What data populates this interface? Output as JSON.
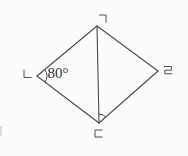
{
  "figure": {
    "type": "geometry-diagram",
    "shape": "quadrilateral-with-diagonal",
    "background": "#fcfcfc",
    "line_color": "#4a4a4a",
    "label_color": "#4f4f4f",
    "angle_text_color": "#2f2f2f",
    "vertices": {
      "top": {
        "label": "ㄱ",
        "glyph": "giyeok",
        "x": 97,
        "y": 26,
        "label_x": 103,
        "label_y": 18
      },
      "left": {
        "label": "ㄴ",
        "glyph": "nieun",
        "x": 37,
        "y": 76,
        "label_x": 27,
        "label_y": 74
      },
      "bottom": {
        "label": "ㄷ",
        "glyph": "digeut",
        "x": 99,
        "y": 123,
        "label_x": 98,
        "label_y": 133
      },
      "right": {
        "label": "ㄹ",
        "glyph": "rieul",
        "x": 158,
        "y": 71,
        "label_x": 168,
        "label_y": 70
      }
    },
    "edges": [
      {
        "from": "top",
        "to": "left"
      },
      {
        "from": "left",
        "to": "bottom"
      },
      {
        "from": "bottom",
        "to": "right"
      },
      {
        "from": "right",
        "to": "top"
      }
    ],
    "diagonal": {
      "from": "top",
      "to": "bottom"
    },
    "angle_marks": [
      {
        "vertex": "left",
        "toward1": "top",
        "toward2": "bottom",
        "radius": 10,
        "label": "80°",
        "label_x": 58,
        "label_y": 73
      },
      {
        "vertex": "bottom",
        "toward1": "top",
        "toward2": "right",
        "radius": 9,
        "label": ""
      }
    ]
  }
}
